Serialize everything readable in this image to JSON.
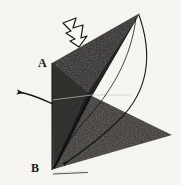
{
  "figure": {
    "kind": "origami-fold-diagram",
    "caption_labels": {
      "vertex_a": "A",
      "vertex_b": "B"
    },
    "background_color": "#f7f6f2",
    "paper_color": "#2f2d2c",
    "paper_color_lower": "#393735",
    "ink_color": "#151515",
    "annotations": {
      "hollow_arrow": {
        "name": "fold-direction-arrow",
        "style": "outlined",
        "direction": "down-right"
      },
      "curved_arrow_left": {
        "name": "unfold-arrow",
        "style": "solid-line-with-head",
        "direction": "left"
      },
      "arc_apex_to_b": {
        "name": "fold-path-arc",
        "style": "thin-curve-with-head",
        "from": "apex",
        "to": "B"
      }
    },
    "geometry": {
      "apex": [
        140,
        13
      ],
      "vertex_a": [
        52,
        63
      ],
      "vertex_b": [
        52,
        170
      ],
      "right_tip": [
        172,
        135
      ],
      "fold_midpoint": [
        92,
        96
      ]
    }
  }
}
